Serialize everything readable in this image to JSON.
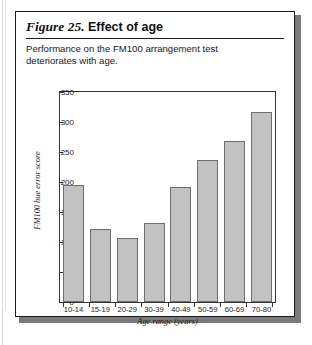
{
  "figure": {
    "number": "Figure 25.",
    "name": "Effect of age",
    "caption": "Performance on the FM100 arrangement test deteriorates with age."
  },
  "chart_data": {
    "type": "bar",
    "title": "Effect of age",
    "categories": [
      "10-14",
      "15-19",
      "20-29",
      "30-39",
      "40-49",
      "50-59",
      "60-69",
      "70-80"
    ],
    "values": [
      195,
      121,
      106,
      131,
      192,
      236,
      269,
      316
    ],
    "xlabel": "Age range (years)",
    "ylabel": "FM100 hue error score",
    "ylim": [
      0,
      350
    ],
    "yticks": [
      0,
      50,
      100,
      150,
      200,
      250,
      300,
      350
    ],
    "grid": false,
    "legend": false,
    "bar_color": "#c2c2c2",
    "bar_border_color": "#6e6e6e"
  }
}
